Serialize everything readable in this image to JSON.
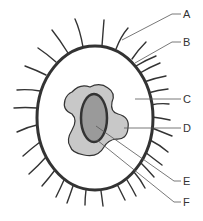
{
  "diagram": {
    "type": "labeled cell diagram",
    "colors": {
      "background": "#ffffff",
      "outline": "#333333",
      "cytoplasm": "#ffffff",
      "inner_body": "#c8c8c8",
      "nucleus": "#9a9a9a",
      "leader_line": "#555555"
    },
    "labels": [
      {
        "id": "A",
        "text": "A",
        "points_to": "hair-like projection"
      },
      {
        "id": "B",
        "text": "B",
        "points_to": "outer membrane"
      },
      {
        "id": "C",
        "text": "C",
        "points_to": "cytoplasm"
      },
      {
        "id": "D",
        "text": "D",
        "points_to": "irregular inner body"
      },
      {
        "id": "E",
        "text": "E",
        "points_to": "nucleus center"
      },
      {
        "id": "F",
        "text": "F",
        "points_to": "nucleus edge"
      }
    ]
  }
}
